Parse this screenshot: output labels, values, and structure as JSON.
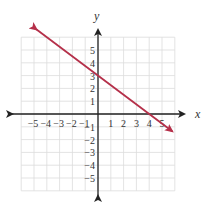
{
  "chart_data": {
    "type": "line",
    "title": "",
    "xlabel": "x",
    "ylabel": "y",
    "xlim": [
      -6,
      6
    ],
    "ylim": [
      -6,
      6
    ],
    "grid": true,
    "x_ticks": [
      "-5",
      "-4",
      "-3",
      "-2",
      "-1",
      "1",
      "2",
      "3",
      "4",
      "5"
    ],
    "y_ticks": [
      "5",
      "4",
      "3",
      "2",
      "1",
      "-1",
      "-2",
      "-3",
      "-4",
      "-5"
    ],
    "series": [
      {
        "name": "line",
        "equation": "y = -3/4 x + 3",
        "x": [
          -4.8,
          0,
          4,
          5.8
        ],
        "y": [
          6.6,
          3,
          0,
          -1.35
        ],
        "color": "#b5304a",
        "arrows_both_ends": true
      }
    ]
  },
  "colors": {
    "grid": "#dcdcdc",
    "axis": "#222222",
    "line": "#b5304a"
  }
}
